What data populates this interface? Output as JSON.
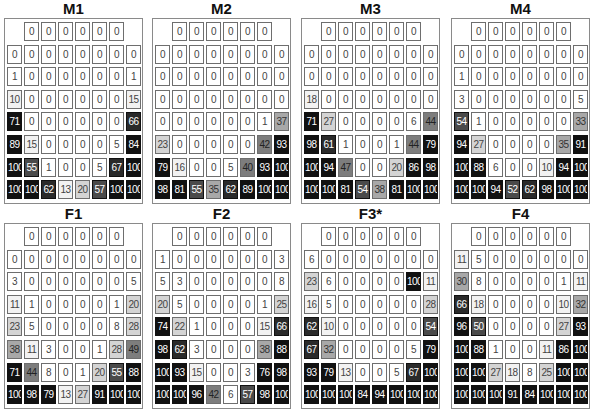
{
  "panels": [
    {
      "title": "M1",
      "rows": [
        [
          null,
          0,
          0,
          0,
          0,
          0,
          0,
          null
        ],
        [
          0,
          0,
          0,
          0,
          0,
          0,
          0,
          0
        ],
        [
          1,
          0,
          0,
          0,
          0,
          0,
          0,
          1
        ],
        [
          10,
          0,
          0,
          0,
          0,
          0,
          0,
          15
        ],
        [
          71,
          0,
          0,
          0,
          0,
          0,
          0,
          66
        ],
        [
          89,
          15,
          0,
          0,
          0,
          0,
          5,
          84
        ],
        [
          100,
          55,
          1,
          0,
          0,
          5,
          67,
          100
        ],
        [
          100,
          100,
          62,
          13,
          20,
          57,
          100,
          100
        ]
      ]
    },
    {
      "title": "M2",
      "rows": [
        [
          null,
          0,
          0,
          0,
          0,
          0,
          0,
          null
        ],
        [
          0,
          0,
          0,
          0,
          0,
          0,
          0,
          0
        ],
        [
          0,
          0,
          0,
          0,
          0,
          0,
          0,
          0
        ],
        [
          0,
          0,
          0,
          0,
          0,
          0,
          0,
          0
        ],
        [
          0,
          0,
          0,
          0,
          0,
          0,
          1,
          37
        ],
        [
          23,
          0,
          0,
          0,
          0,
          0,
          42,
          93
        ],
        [
          79,
          16,
          0,
          0,
          5,
          40,
          93,
          100
        ],
        [
          98,
          81,
          55,
          35,
          62,
          89,
          100,
          100
        ]
      ]
    },
    {
      "title": "M3",
      "rows": [
        [
          null,
          0,
          0,
          0,
          0,
          0,
          0,
          null
        ],
        [
          0,
          0,
          0,
          0,
          0,
          0,
          0,
          0
        ],
        [
          0,
          0,
          0,
          0,
          0,
          0,
          0,
          0
        ],
        [
          18,
          0,
          0,
          0,
          0,
          0,
          0,
          0
        ],
        [
          71,
          27,
          0,
          0,
          0,
          0,
          6,
          44
        ],
        [
          98,
          61,
          1,
          0,
          0,
          1,
          44,
          79
        ],
        [
          100,
          94,
          47,
          0,
          0,
          20,
          86,
          98
        ],
        [
          100,
          100,
          81,
          54,
          38,
          81,
          100,
          100
        ]
      ]
    },
    {
      "title": "M4",
      "rows": [
        [
          null,
          0,
          0,
          0,
          0,
          0,
          0,
          null
        ],
        [
          0,
          0,
          0,
          0,
          0,
          0,
          0,
          0
        ],
        [
          1,
          0,
          0,
          0,
          0,
          0,
          0,
          0
        ],
        [
          3,
          0,
          0,
          0,
          0,
          0,
          0,
          5
        ],
        [
          54,
          1,
          0,
          0,
          0,
          0,
          0,
          33
        ],
        [
          94,
          27,
          0,
          0,
          0,
          0,
          35,
          91
        ],
        [
          100,
          88,
          6,
          0,
          0,
          10,
          94,
          100
        ],
        [
          100,
          100,
          94,
          52,
          62,
          98,
          100,
          100
        ]
      ]
    },
    {
      "title": "F1",
      "rows": [
        [
          null,
          0,
          0,
          0,
          0,
          0,
          0,
          null
        ],
        [
          0,
          0,
          0,
          0,
          0,
          0,
          0,
          0
        ],
        [
          3,
          0,
          0,
          0,
          0,
          0,
          0,
          5
        ],
        [
          11,
          1,
          0,
          0,
          0,
          0,
          1,
          20
        ],
        [
          23,
          5,
          0,
          0,
          0,
          0,
          8,
          28
        ],
        [
          38,
          11,
          3,
          0,
          0,
          1,
          28,
          49
        ],
        [
          71,
          44,
          8,
          0,
          1,
          20,
          55,
          88
        ],
        [
          100,
          98,
          79,
          13,
          27,
          91,
          100,
          100
        ]
      ]
    },
    {
      "title": "F2",
      "rows": [
        [
          null,
          0,
          0,
          0,
          0,
          0,
          0,
          null
        ],
        [
          1,
          0,
          0,
          0,
          0,
          0,
          0,
          3
        ],
        [
          5,
          3,
          0,
          0,
          0,
          0,
          0,
          8
        ],
        [
          20,
          5,
          0,
          0,
          0,
          0,
          1,
          25
        ],
        [
          74,
          22,
          1,
          0,
          0,
          0,
          15,
          66
        ],
        [
          98,
          62,
          3,
          0,
          0,
          0,
          38,
          88
        ],
        [
          100,
          93,
          15,
          0,
          0,
          3,
          76,
          98
        ],
        [
          100,
          100,
          96,
          42,
          6,
          57,
          98,
          100
        ]
      ]
    },
    {
      "title": "F3*",
      "rows": [
        [
          null,
          0,
          0,
          0,
          0,
          0,
          0,
          null
        ],
        [
          6,
          0,
          0,
          0,
          0,
          0,
          0,
          0
        ],
        [
          23,
          6,
          0,
          0,
          0,
          0,
          100,
          11
        ],
        [
          16,
          5,
          0,
          0,
          0,
          0,
          0,
          28
        ],
        [
          62,
          10,
          0,
          0,
          0,
          0,
          0,
          54
        ],
        [
          67,
          32,
          0,
          0,
          0,
          0,
          5,
          79
        ],
        [
          93,
          79,
          13,
          0,
          0,
          5,
          67,
          100
        ],
        [
          100,
          100,
          100,
          84,
          94,
          100,
          100,
          100
        ]
      ]
    },
    {
      "title": "F4",
      "rows": [
        [
          null,
          0,
          0,
          0,
          0,
          0,
          0,
          null
        ],
        [
          11,
          5,
          0,
          0,
          0,
          0,
          0,
          0
        ],
        [
          30,
          8,
          0,
          0,
          0,
          0,
          1,
          11
        ],
        [
          66,
          18,
          0,
          0,
          0,
          0,
          10,
          32
        ],
        [
          96,
          50,
          0,
          0,
          0,
          0,
          27,
          93
        ],
        [
          100,
          88,
          1,
          0,
          0,
          11,
          86,
          100
        ],
        [
          100,
          100,
          27,
          18,
          8,
          25,
          100,
          100
        ],
        [
          100,
          100,
          100,
          91,
          84,
          100,
          100,
          100
        ]
      ]
    }
  ],
  "colors": {
    "background": "#ffffff",
    "border": "#6e6e6e",
    "panel_border": "#8a8a8a",
    "text_light": "#ffffff",
    "text_dark": "#333333"
  }
}
